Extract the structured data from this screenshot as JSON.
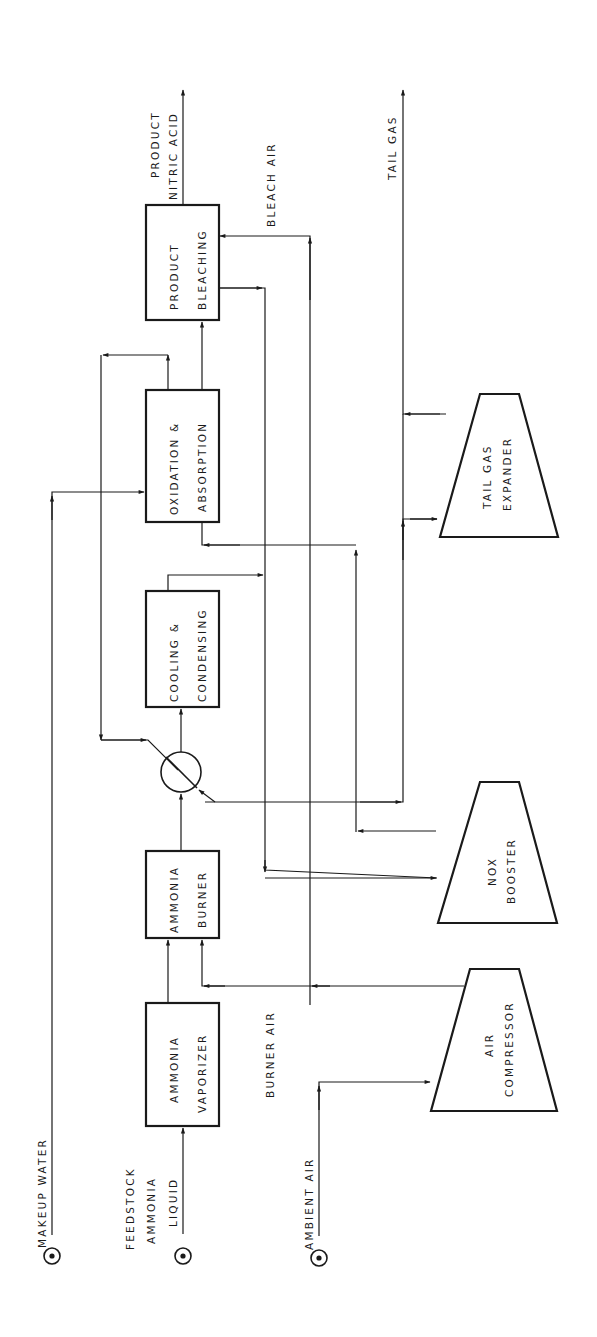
{
  "diagram": {
    "orientation": "rotated-90-ccw",
    "colors": {
      "ink": "#1a1a1a",
      "background": "#ffffff"
    },
    "units": [
      {
        "id": "product_bleaching",
        "line1": "PRODUCT",
        "line2": "BLEACHING"
      },
      {
        "id": "oxidation_absorption",
        "line1": "OXIDATION  &",
        "line2": "ABSORPTION"
      },
      {
        "id": "cooling_condensing",
        "line1": "COOLING  &",
        "line2": "CONDENSING"
      },
      {
        "id": "ammonia_burner",
        "line1": "AMMONIA",
        "line2": "BURNER"
      },
      {
        "id": "ammonia_vaporizer",
        "line1": "AMMONIA",
        "line2": "VAPORIZER"
      }
    ],
    "machines": [
      {
        "id": "tail_gas_expander",
        "line1": "TAIL  GAS",
        "line2": "EXPANDER"
      },
      {
        "id": "nox_booster",
        "line1": "NOX",
        "line2": "BOOSTER"
      },
      {
        "id": "air_compressor",
        "line1": "AIR",
        "line2": "COMPRESSOR"
      }
    ],
    "heat_exchanger": {
      "id": "heat_exchanger",
      "symbol": "circle-with-diagonal"
    },
    "streams": {
      "product_nitric_acid_1": "PRODUCT",
      "product_nitric_acid_2": "NITRIC ACID",
      "bleach_air": "BLEACH AIR",
      "tail_gas": "TAIL  GAS",
      "burner_air": "BURNER AIR",
      "makeup_water": "MAKEUP  WATER",
      "feedstock_1": "FEEDSTOCK",
      "feedstock_2": "AMMONIA",
      "feedstock_3": "LIQUID",
      "ambient_air": "AMBIENT AIR"
    },
    "sources": [
      {
        "id": "makeup_water_source",
        "symbol": "circled-dot"
      },
      {
        "id": "feedstock_source",
        "symbol": "circled-dot"
      },
      {
        "id": "ambient_air_source",
        "symbol": "circled-dot"
      }
    ]
  }
}
